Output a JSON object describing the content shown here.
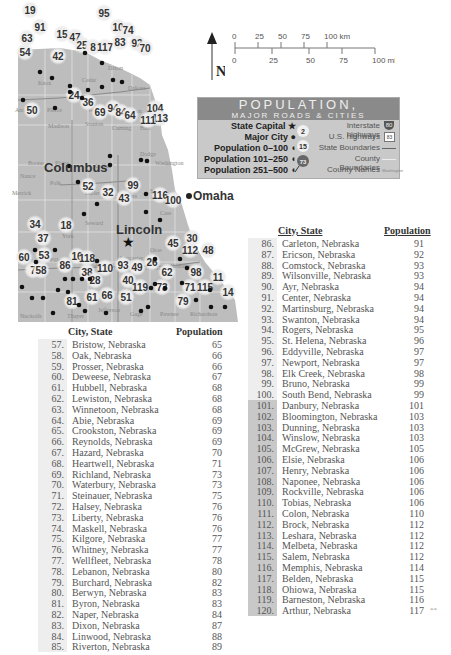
{
  "map": {
    "major_cities": [
      {
        "name": "Lincoln",
        "role": "State Capital"
      },
      {
        "name": "Omaha",
        "role": "Major City"
      },
      {
        "name": "Columbus",
        "role": "Major City"
      }
    ],
    "counties": [
      "Knox",
      "Cedar",
      "Dixon",
      "Dakota",
      "Antelope",
      "Pierce",
      "Wayne",
      "Thurston",
      "Madison",
      "Stanton",
      "Cuming",
      "Burt",
      "Boone",
      "Platte",
      "Colfax",
      "Dodge",
      "Washington",
      "Nance",
      "Merrick",
      "Polk",
      "Butler",
      "Saunders",
      "Sarpy",
      "Cass",
      "Seward",
      "York",
      "Lancaster",
      "Otoe",
      "Fillmore",
      "Saline",
      "Johnson",
      "Nemaha",
      "Nuckolls",
      "Thayer",
      "Jefferson",
      "Gage",
      "Pawnee",
      "Richardson"
    ],
    "callouts": [
      "19",
      "91",
      "95",
      "10",
      "74",
      "63",
      "15",
      "47",
      "25",
      "8",
      "117",
      "83",
      "92",
      "70",
      "54",
      "42",
      "24",
      "36",
      "50",
      "69",
      "94",
      "84",
      "104",
      "113",
      "111",
      "64",
      "52",
      "32",
      "99",
      "43",
      "116",
      "100",
      "34",
      "18",
      "37",
      "45",
      "30",
      "112",
      "48",
      "53",
      "16",
      "118",
      "86",
      "60",
      "7",
      "58",
      "38",
      "110",
      "93",
      "49",
      "26",
      "62",
      "98",
      "28",
      "40",
      "119",
      "73",
      "71",
      "115",
      "11",
      "14",
      "81",
      "61",
      "66",
      "51",
      "79"
    ],
    "highway_shields": [
      "20",
      "81",
      "275",
      "77",
      "30",
      "15",
      "6",
      "34",
      "2",
      "80",
      "77",
      "136",
      "75",
      "8",
      "81"
    ]
  },
  "compass": {
    "label": "N"
  },
  "scale": {
    "km_ticks": [
      "0",
      "25",
      "50",
      "75",
      "100 km"
    ],
    "mi_ticks": [
      "0",
      "25",
      "50",
      "75",
      "100 mi"
    ]
  },
  "legend": {
    "title": "POPULATION,",
    "subtitle": "MAJOR ROADS & CITIES",
    "left": [
      {
        "label": "State Capital",
        "icon": "star-icon"
      },
      {
        "label": "Major City",
        "icon": "dot-icon"
      },
      {
        "label": "Population 0–100",
        "icon": "small-pin-icon"
      },
      {
        "label": "Population 101–250",
        "icon": "small-pin-icon"
      },
      {
        "label": "Population 251–500",
        "icon": "small-pin-icon"
      }
    ],
    "markers": [
      "2",
      "15",
      "73"
    ],
    "right": [
      {
        "label": "Interstate highways",
        "shield": "80"
      },
      {
        "label": "U.S. highways",
        "shield": "83"
      },
      {
        "label": "State Boundaries"
      },
      {
        "label": "County Boundaries"
      },
      {
        "label": "County Names",
        "sample": "Washington"
      }
    ]
  },
  "table_left": {
    "header_city": "City, State",
    "header_pop": "Population",
    "rows": [
      {
        "n": "57.",
        "city": "Bristow, Nebraska",
        "pop": "65"
      },
      {
        "n": "58.",
        "city": "Oak, Nebraska",
        "pop": "66"
      },
      {
        "n": "59.",
        "city": "Prosser, Nebraska",
        "pop": "66"
      },
      {
        "n": "60.",
        "city": "Deweese, Nebraska",
        "pop": "67"
      },
      {
        "n": "61.",
        "city": "Hubbell, Nebraska",
        "pop": "68"
      },
      {
        "n": "62.",
        "city": "Lewiston, Nebraska",
        "pop": "68"
      },
      {
        "n": "63.",
        "city": "Winnetoon, Nebraska",
        "pop": "68"
      },
      {
        "n": "64.",
        "city": "Abie, Nebraska",
        "pop": "69"
      },
      {
        "n": "65.",
        "city": "Crookston, Nebraska",
        "pop": "69"
      },
      {
        "n": "66.",
        "city": "Reynolds, Nebraska",
        "pop": "69"
      },
      {
        "n": "67.",
        "city": "Hazard, Nebraska",
        "pop": "70"
      },
      {
        "n": "68.",
        "city": "Heartwell, Nebraska",
        "pop": "71"
      },
      {
        "n": "69.",
        "city": "Richland, Nebraska",
        "pop": "73"
      },
      {
        "n": "70.",
        "city": "Waterbury, Nebraska",
        "pop": "73"
      },
      {
        "n": "71.",
        "city": "Steinauer, Nebraska",
        "pop": "75"
      },
      {
        "n": "72.",
        "city": "Halsey, Nebraska",
        "pop": "76"
      },
      {
        "n": "73.",
        "city": "Liberty, Nebraska",
        "pop": "76"
      },
      {
        "n": "74.",
        "city": "Maskell, Nebraska",
        "pop": "76"
      },
      {
        "n": "75.",
        "city": "Kilgore, Nebraska",
        "pop": "77"
      },
      {
        "n": "76.",
        "city": "Whitney, Nebraska",
        "pop": "77"
      },
      {
        "n": "77.",
        "city": "Wellfleet, Nebraska",
        "pop": "78"
      },
      {
        "n": "78.",
        "city": "Lebanon, Nebraska",
        "pop": "80"
      },
      {
        "n": "79.",
        "city": "Burchard, Nebraska",
        "pop": "82"
      },
      {
        "n": "80.",
        "city": "Berwyn, Nebraska",
        "pop": "83"
      },
      {
        "n": "81.",
        "city": "Byron, Nebraska",
        "pop": "83"
      },
      {
        "n": "82.",
        "city": "Naper, Nebraska",
        "pop": "84"
      },
      {
        "n": "83.",
        "city": "Dixon, Nebraska",
        "pop": "87"
      },
      {
        "n": "84.",
        "city": "Linwood, Nebraska",
        "pop": "88"
      },
      {
        "n": "85.",
        "city": "Riverton, Nebraska",
        "pop": "89"
      }
    ]
  },
  "table_right": {
    "header_city": "City, State",
    "header_pop": "Population",
    "footnote": "**",
    "rows": [
      {
        "n": "86.",
        "city": "Carleton, Nebraska",
        "pop": "91"
      },
      {
        "n": "87.",
        "city": "Ericson, Nebraska",
        "pop": "92"
      },
      {
        "n": "88.",
        "city": "Comstock, Nebraska",
        "pop": "93"
      },
      {
        "n": "89.",
        "city": "Wilsonville, Nebraska",
        "pop": "93"
      },
      {
        "n": "90.",
        "city": "Ayr, Nebraska",
        "pop": "94"
      },
      {
        "n": "91.",
        "city": "Center, Nebraska",
        "pop": "94"
      },
      {
        "n": "92.",
        "city": "Martinsburg, Nebraska",
        "pop": "94"
      },
      {
        "n": "93.",
        "city": "Swanton, Nebraska",
        "pop": "94"
      },
      {
        "n": "94.",
        "city": "Rogers, Nebraska",
        "pop": "95"
      },
      {
        "n": "95.",
        "city": "St. Helena, Nebraska",
        "pop": "96"
      },
      {
        "n": "96.",
        "city": "Eddyville, Nebraska",
        "pop": "97"
      },
      {
        "n": "97.",
        "city": "Newport, Nebraska",
        "pop": "97"
      },
      {
        "n": "98.",
        "city": "Elk Creek, Nebraska",
        "pop": "98"
      },
      {
        "n": "99.",
        "city": "Bruno, Nebraska",
        "pop": "99"
      },
      {
        "n": "100.",
        "city": "South Bend, Nebraska",
        "pop": "99"
      },
      {
        "n": "101.",
        "city": "Danbury, Nebraska",
        "pop": "101"
      },
      {
        "n": "102.",
        "city": "Bloomington, Nebraska",
        "pop": "103"
      },
      {
        "n": "103.",
        "city": "Dunning, Nebraska",
        "pop": "103"
      },
      {
        "n": "104.",
        "city": "Winslow, Nebraska",
        "pop": "103"
      },
      {
        "n": "105.",
        "city": "McGrew, Nebraska",
        "pop": "105"
      },
      {
        "n": "106.",
        "city": "Elsie, Nebraska",
        "pop": "106"
      },
      {
        "n": "107.",
        "city": "Henry, Nebraska",
        "pop": "106"
      },
      {
        "n": "108.",
        "city": "Naponee, Nebraska",
        "pop": "106"
      },
      {
        "n": "109.",
        "city": "Rockville, Nebraska",
        "pop": "106"
      },
      {
        "n": "110.",
        "city": "Tobias, Nebraska",
        "pop": "106"
      },
      {
        "n": "111.",
        "city": "Colon, Nebraska",
        "pop": "110"
      },
      {
        "n": "112.",
        "city": "Brock, Nebraska",
        "pop": "112"
      },
      {
        "n": "113.",
        "city": "Leshara, Nebraska",
        "pop": "112"
      },
      {
        "n": "114.",
        "city": "Melbeta, Nebraska",
        "pop": "112"
      },
      {
        "n": "115.",
        "city": "Salem, Nebraska",
        "pop": "112"
      },
      {
        "n": "116.",
        "city": "Memphis, Nebraska",
        "pop": "114"
      },
      {
        "n": "117.",
        "city": "Belden, Nebraska",
        "pop": "115"
      },
      {
        "n": "118.",
        "city": "Ohiowa, Nebraska",
        "pop": "115"
      },
      {
        "n": "119.",
        "city": "Barneston, Nebraska",
        "pop": "116"
      },
      {
        "n": "120.",
        "city": "Arthur, Nebraska",
        "pop": "117"
      }
    ]
  }
}
